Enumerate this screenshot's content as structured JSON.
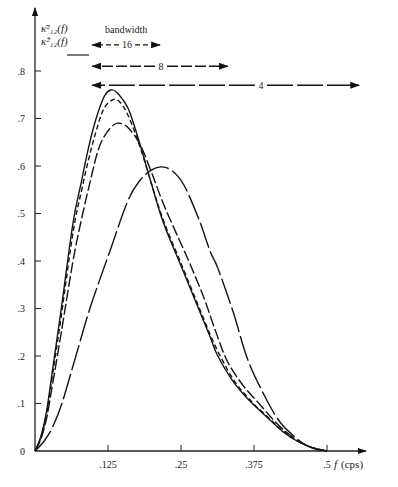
{
  "chart_data": {
    "type": "line",
    "title": "",
    "xlabel": "f (cps)",
    "xlabel_var": "f",
    "xlabel_unit": "(cps)",
    "ylabel_lines": [
      "κ̄²₁₂(f)",
      "κ̂²₁₂(f)"
    ],
    "xlim": [
      0,
      0.5
    ],
    "ylim": [
      0,
      0.8
    ],
    "x_ticks": [
      0.125,
      0.25,
      0.375,
      0.5
    ],
    "x_tick_labels": [
      ".125",
      ".25",
      ".375",
      ".5"
    ],
    "y_ticks": [
      0,
      0.1,
      0.2,
      0.3,
      0.4,
      0.5,
      0.6,
      0.7,
      0.8
    ],
    "y_tick_labels": [
      "0",
      ".1",
      ".2",
      ".3",
      ".4",
      ".5",
      ".6",
      ".7",
      ".8"
    ],
    "grid": false,
    "legend_title": "bandwidth",
    "bandwidth_arrows": [
      {
        "label": "16",
        "f_start": 0.098,
        "f_end": 0.214,
        "value": 0.855,
        "style": "short-dash"
      },
      {
        "label": "8",
        "f_start": 0.098,
        "f_end": 0.33,
        "value": 0.81,
        "style": "medium-dash"
      },
      {
        "label": "4",
        "f_start": 0.098,
        "f_end": 0.555,
        "value": 0.77,
        "style": "long-dash"
      }
    ],
    "series": [
      {
        "name": "true coherency",
        "style": "solid",
        "x": [
          0,
          0.01,
          0.02,
          0.03,
          0.045,
          0.065,
          0.08,
          0.09,
          0.1,
          0.11,
          0.12,
          0.13,
          0.14,
          0.16,
          0.18,
          0.2,
          0.22,
          0.25,
          0.28,
          0.3,
          0.313,
          0.34,
          0.368,
          0.4,
          0.425,
          0.45,
          0.475,
          0.5
        ],
        "values": [
          0,
          0.03,
          0.085,
          0.17,
          0.3,
          0.48,
          0.57,
          0.63,
          0.68,
          0.72,
          0.75,
          0.76,
          0.755,
          0.72,
          0.645,
          0.56,
          0.48,
          0.39,
          0.3,
          0.24,
          0.2,
          0.145,
          0.105,
          0.068,
          0.04,
          0.02,
          0.007,
          0
        ]
      },
      {
        "name": "bandwidth 16",
        "style": "short-dash",
        "x": [
          0,
          0.01,
          0.02,
          0.03,
          0.045,
          0.065,
          0.08,
          0.095,
          0.11,
          0.12,
          0.134,
          0.145,
          0.16,
          0.18,
          0.2,
          0.22,
          0.25,
          0.28,
          0.3,
          0.315,
          0.34,
          0.37,
          0.4,
          0.425,
          0.45,
          0.475,
          0.5
        ],
        "values": [
          0,
          0.028,
          0.08,
          0.16,
          0.285,
          0.46,
          0.55,
          0.63,
          0.695,
          0.725,
          0.74,
          0.735,
          0.705,
          0.64,
          0.56,
          0.485,
          0.395,
          0.305,
          0.245,
          0.205,
          0.15,
          0.105,
          0.07,
          0.042,
          0.021,
          0.007,
          0
        ]
      },
      {
        "name": "bandwidth 8",
        "style": "medium-dash",
        "x": [
          0,
          0.01,
          0.02,
          0.03,
          0.045,
          0.065,
          0.08,
          0.095,
          0.108,
          0.12,
          0.135,
          0.145,
          0.16,
          0.18,
          0.2,
          0.22,
          0.245,
          0.265,
          0.29,
          0.31,
          0.329,
          0.355,
          0.38,
          0.405,
          0.425,
          0.45,
          0.475,
          0.5
        ],
        "values": [
          0,
          0.025,
          0.07,
          0.14,
          0.25,
          0.4,
          0.49,
          0.57,
          0.633,
          0.665,
          0.687,
          0.69,
          0.68,
          0.645,
          0.585,
          0.52,
          0.45,
          0.395,
          0.32,
          0.25,
          0.19,
          0.14,
          0.105,
          0.07,
          0.045,
          0.022,
          0.007,
          0
        ]
      },
      {
        "name": "bandwidth 4",
        "style": "long-dash",
        "x": [
          0,
          0.015,
          0.03,
          0.046,
          0.07,
          0.094,
          0.128,
          0.159,
          0.18,
          0.2,
          0.217,
          0.235,
          0.255,
          0.28,
          0.3,
          0.313,
          0.34,
          0.365,
          0.397,
          0.42,
          0.44,
          0.46,
          0.48,
          0.5
        ],
        "values": [
          0,
          0.02,
          0.05,
          0.1,
          0.2,
          0.3,
          0.42,
          0.527,
          0.57,
          0.592,
          0.598,
          0.59,
          0.56,
          0.49,
          0.42,
          0.385,
          0.29,
          0.19,
          0.107,
          0.06,
          0.035,
          0.015,
          0.004,
          0
        ]
      }
    ]
  }
}
